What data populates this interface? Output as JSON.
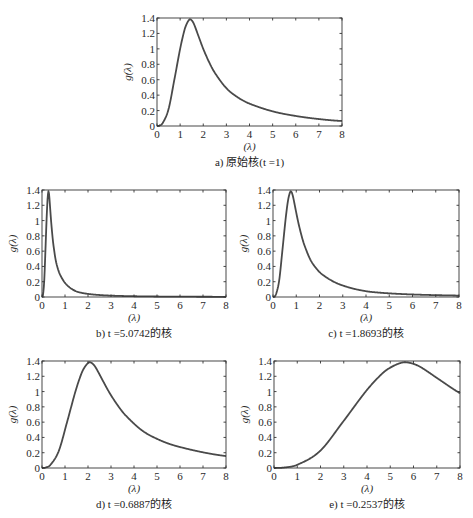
{
  "chart_data": [
    {
      "id": "a",
      "type": "line",
      "caption": "a) 原始核(t =1)",
      "t": 1,
      "xlabel": "(λ)",
      "ylabel": "g(λ)",
      "xlim": [
        0,
        8
      ],
      "ylim": [
        0,
        1.4
      ],
      "xticks": [
        "0",
        "1",
        "2",
        "3",
        "4",
        "5",
        "6",
        "7",
        "8"
      ],
      "yticks": [
        "0",
        "0.2",
        "0.4",
        "0.6",
        "0.8",
        "1",
        "1.2",
        "1.4"
      ],
      "grid": false,
      "peak": {
        "x": 1.4,
        "y": 1.38
      },
      "box": {
        "x0": 157,
        "x1": 342,
        "y0": 18,
        "y1": 126
      }
    },
    {
      "id": "b",
      "type": "line",
      "caption": "b) t =5.0742的核",
      "t": 5.0742,
      "xlabel": "(λ)",
      "ylabel": "g(λ)",
      "xlim": [
        0,
        8
      ],
      "ylim": [
        0,
        1.4
      ],
      "xticks": [
        "0",
        "1",
        "2",
        "3",
        "4",
        "5",
        "6",
        "7",
        "8"
      ],
      "yticks": [
        "0",
        "0.2",
        "0.4",
        "0.6",
        "0.8",
        "1",
        "1.2",
        "1.4"
      ],
      "grid": false,
      "peak": {
        "x": 0.28,
        "y": 1.32
      },
      "box": {
        "x0": 42,
        "x1": 226,
        "y0": 190,
        "y1": 297
      }
    },
    {
      "id": "c",
      "type": "line",
      "caption": "c) t =1.8693的核",
      "t": 1.8693,
      "xlabel": "(λ)",
      "ylabel": "g(λ)",
      "xlim": [
        0,
        8
      ],
      "ylim": [
        0,
        1.4
      ],
      "xticks": [
        "0",
        "1",
        "2",
        "3",
        "4",
        "5",
        "6",
        "7",
        "8"
      ],
      "yticks": [
        "0",
        "0.2",
        "0.4",
        "0.6",
        "0.8",
        "1",
        "1.2",
        "1.4"
      ],
      "grid": false,
      "peak": {
        "x": 0.75,
        "y": 1.37
      },
      "box": {
        "x0": 273,
        "x1": 459,
        "y0": 190,
        "y1": 297
      }
    },
    {
      "id": "d",
      "type": "line",
      "caption": "d) t =0.6887的核",
      "t": 0.6887,
      "xlabel": "(λ)",
      "ylabel": "g(λ)",
      "xlim": [
        0,
        8
      ],
      "ylim": [
        0,
        1.4
      ],
      "xticks": [
        "0",
        "1",
        "2",
        "3",
        "4",
        "5",
        "6",
        "7",
        "8"
      ],
      "yticks": [
        "0",
        "0.2",
        "0.4",
        "0.6",
        "0.8",
        "1",
        "1.2",
        "1.4"
      ],
      "grid": false,
      "peak": {
        "x": 2.05,
        "y": 1.38
      },
      "box": {
        "x0": 42,
        "x1": 226,
        "y0": 361,
        "y1": 468
      }
    },
    {
      "id": "e",
      "type": "line",
      "caption": "e) t =0.2537的核",
      "t": 0.2537,
      "xlabel": "(λ)",
      "ylabel": "g(λ)",
      "xlim": [
        0,
        8
      ],
      "ylim": [
        0,
        1.4
      ],
      "xticks": [
        "0",
        "1",
        "2",
        "3",
        "4",
        "5",
        "6",
        "7",
        "8"
      ],
      "yticks": [
        "0",
        "0.2",
        "0.4",
        "0.6",
        "0.8",
        "1",
        "1.2",
        "1.4"
      ],
      "grid": false,
      "peak": {
        "x": 5.6,
        "y": 1.38
      },
      "box": {
        "x0": 274,
        "x1": 460,
        "y0": 361,
        "y1": 468
      }
    }
  ],
  "base_kernel": {
    "x": [
      0,
      0.1,
      0.25,
      0.5,
      0.75,
      1.0,
      1.15,
      1.25,
      1.4,
      1.5,
      1.6,
      1.8,
      2.0,
      2.25,
      2.5,
      3.0,
      3.5,
      4.0,
      5.0,
      6.0,
      7.0,
      8.0
    ],
    "y": [
      0,
      0.005,
      0.04,
      0.22,
      0.6,
      1.0,
      1.2,
      1.3,
      1.38,
      1.37,
      1.32,
      1.16,
      1.0,
      0.83,
      0.69,
      0.49,
      0.37,
      0.29,
      0.19,
      0.13,
      0.09,
      0.065
    ]
  },
  "style": {
    "line_color": "#4a4a4a",
    "axis_color": "#333333"
  }
}
